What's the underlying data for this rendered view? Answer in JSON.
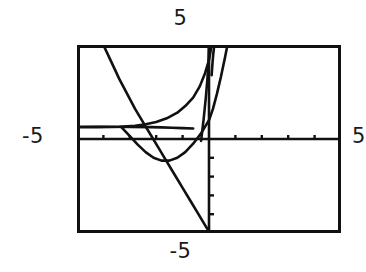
{
  "device": {
    "kind": "graphing-calculator-screen",
    "background_color": "#ffffff",
    "ink_color": "#111111"
  },
  "window_labels": {
    "ymax": "5",
    "ymin": "-5",
    "xmin": "-5",
    "xmax": "5"
  },
  "chart_data": {
    "type": "line",
    "title": "",
    "subtitle": "",
    "xlabel": "",
    "ylabel": "",
    "xlim": [
      -5,
      5
    ],
    "ylim": [
      -5,
      5
    ],
    "grid": false,
    "legend": null,
    "legend_position": "none",
    "axes": {
      "x_axis_y": 0,
      "y_axis_x": 0,
      "tick_spacing_x": 1,
      "tick_spacing_y": 1,
      "x_tick_values": [
        -5,
        -4,
        -3,
        -2,
        -1,
        1,
        2,
        3,
        4,
        5
      ],
      "y_tick_values": [
        -5,
        -4,
        -3,
        -2,
        -1,
        1,
        2,
        3,
        4,
        5
      ],
      "x_ticks_visible": true,
      "y_ticks_visible": true,
      "y_ticks_drawn_range": [
        -5,
        0
      ]
    },
    "annotations": [
      "window range -5 to 5 on both axes",
      "three curves exit through the top of the window near x = 0",
      "parabola vertex below the x-axis near x = -1.7",
      "horizontal segment drawn left of center above the x-axis"
    ],
    "series": [
      {
        "name": "horizontal-segment",
        "style": "solid",
        "color": "#111111",
        "points": [
          [
            -5.0,
            0.65
          ],
          [
            -4.0,
            0.65
          ],
          [
            -3.0,
            0.64
          ],
          [
            -2.2,
            0.63
          ],
          [
            -1.8,
            0.62
          ],
          [
            -1.4,
            0.6
          ],
          [
            -1.0,
            0.58
          ],
          [
            -0.6,
            0.56
          ]
        ]
      },
      {
        "name": "descending-branch",
        "style": "solid",
        "color": "#111111",
        "points": [
          [
            -4.0,
            5.0
          ],
          [
            -3.7,
            4.1
          ],
          [
            -3.4,
            3.2
          ],
          [
            -3.1,
            2.4
          ],
          [
            -2.8,
            1.6
          ],
          [
            -2.5,
            0.9
          ],
          [
            -2.2,
            0.2
          ],
          [
            -1.9,
            -0.5
          ],
          [
            -1.6,
            -1.2
          ],
          [
            -1.3,
            -1.9
          ],
          [
            -1.0,
            -2.6
          ],
          [
            -0.7,
            -3.3
          ],
          [
            -0.4,
            -4.0
          ],
          [
            -0.1,
            -4.7
          ],
          [
            0.05,
            -5.0
          ]
        ]
      },
      {
        "name": "wide-parabola",
        "style": "solid",
        "color": "#111111",
        "points": [
          [
            -3.3,
            0.6
          ],
          [
            -3.0,
            0.15
          ],
          [
            -2.7,
            -0.3
          ],
          [
            -2.4,
            -0.7
          ],
          [
            -2.1,
            -1.0
          ],
          [
            -1.8,
            -1.15
          ],
          [
            -1.5,
            -1.15
          ],
          [
            -1.2,
            -1.0
          ],
          [
            -0.9,
            -0.7
          ],
          [
            -0.6,
            -0.25
          ],
          [
            -0.3,
            0.3
          ],
          [
            0.0,
            1.0
          ],
          [
            0.15,
            1.6
          ],
          [
            0.3,
            2.4
          ],
          [
            0.45,
            3.3
          ],
          [
            0.6,
            4.3
          ],
          [
            0.7,
            5.0
          ]
        ]
      },
      {
        "name": "rising-curve",
        "style": "solid",
        "color": "#111111",
        "points": [
          [
            -5.0,
            0.62
          ],
          [
            -4.2,
            0.63
          ],
          [
            -3.4,
            0.65
          ],
          [
            -2.8,
            0.7
          ],
          [
            -2.4,
            0.78
          ],
          [
            -2.0,
            0.9
          ],
          [
            -1.6,
            1.1
          ],
          [
            -1.2,
            1.4
          ],
          [
            -0.9,
            1.75
          ],
          [
            -0.6,
            2.2
          ],
          [
            -0.35,
            2.8
          ],
          [
            -0.15,
            3.5
          ],
          [
            0.0,
            4.2
          ],
          [
            0.1,
            5.0
          ]
        ]
      },
      {
        "name": "steep-curve-left",
        "style": "solid",
        "color": "#111111",
        "points": [
          [
            -0.3,
            -0.1
          ],
          [
            -0.2,
            1.1
          ],
          [
            -0.12,
            2.2
          ],
          [
            -0.06,
            3.2
          ],
          [
            -0.02,
            4.1
          ],
          [
            0.0,
            5.0
          ]
        ]
      },
      {
        "name": "steep-curve-mid",
        "style": "solid",
        "color": "#111111",
        "points": [
          [
            0.1,
            3.4
          ],
          [
            0.13,
            4.0
          ],
          [
            0.16,
            4.5
          ],
          [
            0.2,
            5.0
          ]
        ]
      }
    ]
  }
}
